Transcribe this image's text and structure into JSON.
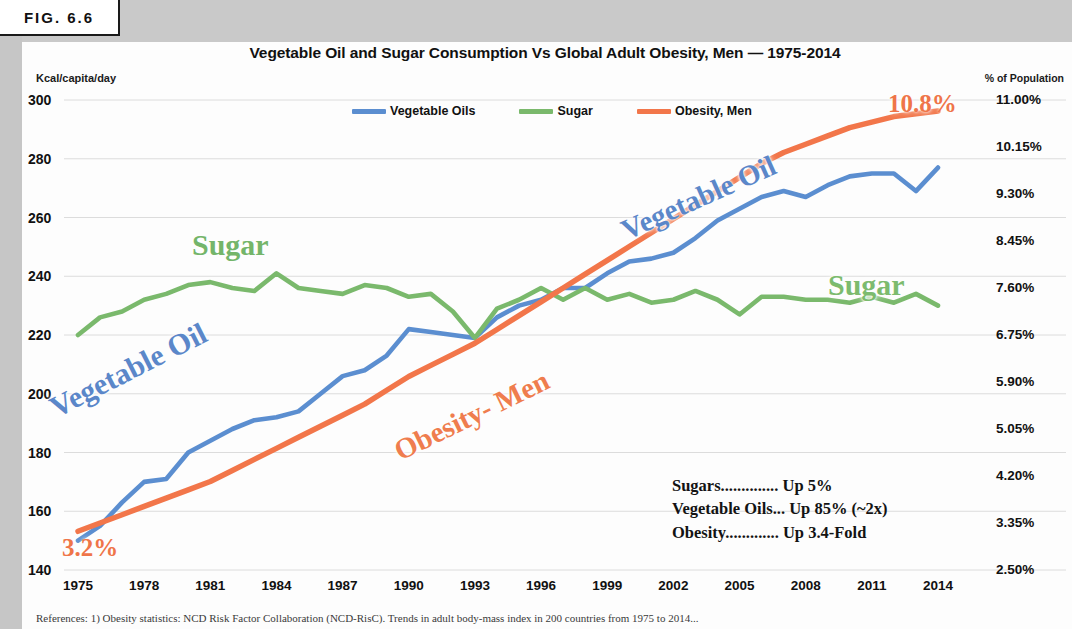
{
  "figure": {
    "tab_label": "FIG. 6.6"
  },
  "chart_data": {
    "type": "line",
    "title": "Vegetable Oil and Sugar Consumption Vs Global Adult Obesity, Men — 1975-2014",
    "xlabel": "",
    "ylabel": "Kcal/capita/day",
    "y2label": "% of Population",
    "grid": true,
    "legend_position": "top-center",
    "xlim": [
      1975,
      2014
    ],
    "ylim": [
      140,
      300
    ],
    "y2lim": [
      2.5,
      11.0
    ],
    "xticks": [
      "1975",
      "1978",
      "1981",
      "1984",
      "1987",
      "1990",
      "1993",
      "1996",
      "1999",
      "2002",
      "2005",
      "2008",
      "2011",
      "2014"
    ],
    "yticks": [
      "300",
      "280",
      "260",
      "240",
      "220",
      "200",
      "180",
      "160",
      "140"
    ],
    "y2ticks": [
      "11.00%",
      "10.15%",
      "9.30%",
      "8.45%",
      "7.60%",
      "6.75%",
      "5.90%",
      "5.05%",
      "4.20%",
      "3.35%",
      "2.50%"
    ],
    "x": [
      1975,
      1976,
      1977,
      1978,
      1979,
      1980,
      1981,
      1982,
      1983,
      1984,
      1985,
      1986,
      1987,
      1988,
      1989,
      1990,
      1991,
      1992,
      1993,
      1994,
      1995,
      1996,
      1997,
      1998,
      1999,
      2000,
      2001,
      2002,
      2003,
      2004,
      2005,
      2006,
      2007,
      2008,
      2009,
      2010,
      2011,
      2012,
      2013,
      2014
    ],
    "series": [
      {
        "name": "Vegetable Oils",
        "color": "#5b8ed0",
        "axis": "left",
        "unit": "Kcal/capita/day",
        "values": [
          150,
          155,
          163,
          170,
          171,
          180,
          184,
          188,
          191,
          192,
          194,
          200,
          206,
          208,
          213,
          222,
          221,
          220,
          219,
          226,
          230,
          232,
          236,
          236,
          241,
          245,
          246,
          248,
          253,
          259,
          263,
          267,
          269,
          267,
          271,
          274,
          275,
          275,
          269,
          277
        ]
      },
      {
        "name": "Sugar",
        "color": "#7ab96c",
        "axis": "left",
        "unit": "Kcal/capita/day",
        "values": [
          220,
          226,
          228,
          232,
          234,
          237,
          238,
          236,
          235,
          241,
          236,
          235,
          234,
          237,
          236,
          233,
          234,
          228,
          219,
          229,
          232,
          236,
          232,
          236,
          232,
          234,
          231,
          232,
          235,
          232,
          227,
          233,
          233,
          232,
          232,
          231,
          233,
          231,
          234,
          230
        ]
      },
      {
        "name": "Obesity, Men",
        "color": "#f2764a",
        "axis": "right",
        "unit": "% of Population",
        "values": [
          3.2,
          3.35,
          3.5,
          3.65,
          3.8,
          3.95,
          4.1,
          4.3,
          4.5,
          4.7,
          4.9,
          5.1,
          5.3,
          5.5,
          5.75,
          6.0,
          6.2,
          6.4,
          6.6,
          6.85,
          7.1,
          7.35,
          7.6,
          7.85,
          8.1,
          8.35,
          8.6,
          8.85,
          9.1,
          9.35,
          9.6,
          9.85,
          10.05,
          10.2,
          10.35,
          10.5,
          10.6,
          10.7,
          10.75,
          10.8
        ]
      }
    ],
    "annotations": [
      {
        "name": "veg-oil-left",
        "text": "Vegetable Oil",
        "color": "#5b87c9"
      },
      {
        "name": "veg-oil-right",
        "text": "Vegetable Oil",
        "color": "#5b87c9"
      },
      {
        "name": "sugar-left",
        "text": "Sugar",
        "color": "#74b56a"
      },
      {
        "name": "sugar-right",
        "text": "Sugar",
        "color": "#7cbb6e"
      },
      {
        "name": "obesity-men",
        "text": "Obesity- Men",
        "color": "#ef7d4e"
      },
      {
        "name": "obesity-start-value",
        "text": "3.2%",
        "color": "#ef7549"
      },
      {
        "name": "obesity-end-value",
        "text": "10.8%",
        "color": "#ef7549"
      }
    ]
  },
  "legend": {
    "items": [
      {
        "label": "Vegetable Oils",
        "color": "#5b8ed0"
      },
      {
        "label": "Sugar",
        "color": "#7ab96c"
      },
      {
        "label": "Obesity, Men",
        "color": "#f2764a"
      }
    ]
  },
  "summary": {
    "rows": [
      "Sugars.............. Up 5%",
      "Vegetable Oils... Up 85% (~2x)",
      "Obesity............. Up 3.4-Fold"
    ]
  },
  "references": {
    "text": "References:  1) Obesity statistics: NCD Risk Factor Collaboration (NCD-RisC). Trends in adult body-mass index in 200 countries from 1975 to 2014..."
  }
}
